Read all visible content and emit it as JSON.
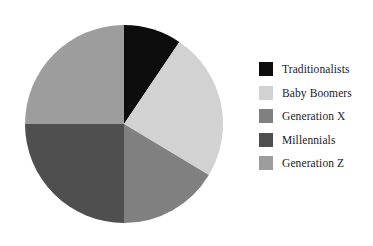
{
  "chart_data": {
    "type": "pie",
    "title": "",
    "categories": [
      "Traditionalists",
      "Baby Boomers",
      "Generation X",
      "Millennials",
      "Generation Z"
    ],
    "values": [
      9.4,
      24.2,
      16.4,
      25.0,
      25.0
    ],
    "units": "percent",
    "start_angle_deg": 0,
    "direction": "clockwise",
    "slice_boundaries_deg": [
      0,
      34,
      121,
      180,
      270,
      360
    ],
    "colors": [
      "#0d0d0d",
      "#d2d2d2",
      "#808080",
      "#4f4f4f",
      "#9d9d9d"
    ],
    "legend_position": "right",
    "grid": false,
    "xlabel": "",
    "ylabel": "",
    "slices": [
      {
        "label": "Traditionalists",
        "value": 9.4,
        "color": "#0d0d0d",
        "start_deg": 0,
        "end_deg": 34
      },
      {
        "label": "Baby Boomers",
        "value": 24.2,
        "color": "#d2d2d2",
        "start_deg": 34,
        "end_deg": 121
      },
      {
        "label": "Generation X",
        "value": 16.4,
        "color": "#808080",
        "start_deg": 121,
        "end_deg": 180
      },
      {
        "label": "Millennials",
        "value": 25.0,
        "color": "#4f4f4f",
        "start_deg": 180,
        "end_deg": 270
      },
      {
        "label": "Generation Z",
        "value": 25.0,
        "color": "#9d9d9d",
        "start_deg": 270,
        "end_deg": 360
      }
    ],
    "geometry": {
      "center_x": 124,
      "center_y": 124,
      "radius": 99
    }
  },
  "legend": {
    "items": [
      {
        "label": "Traditionalists",
        "color": "#0d0d0d"
      },
      {
        "label": "Baby Boomers",
        "color": "#d2d2d2"
      },
      {
        "label": "Generation X",
        "color": "#808080"
      },
      {
        "label": "Millennials",
        "color": "#4f4f4f"
      },
      {
        "label": "Generation Z",
        "color": "#9d9d9d"
      }
    ]
  },
  "background_color": "#ffffff"
}
